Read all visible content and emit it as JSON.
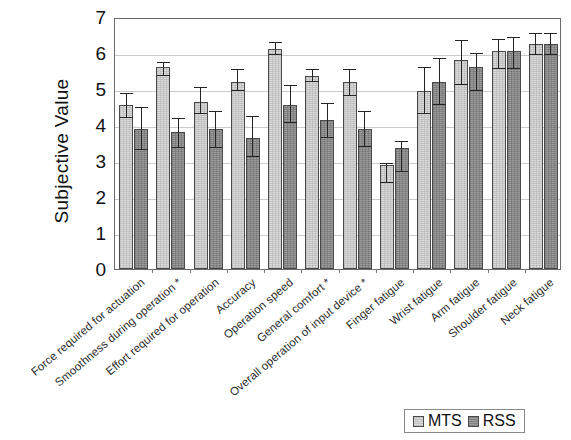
{
  "chart_data": {
    "type": "bar",
    "title": "",
    "xlabel": "",
    "ylabel": "Subjective Value",
    "ylim": [
      0,
      7
    ],
    "yticks": [
      0,
      1,
      2,
      3,
      4,
      5,
      6,
      7
    ],
    "grid": true,
    "legend_position": "bottom-right",
    "categories": [
      "Force required for actuation",
      "Smoothness during operation *",
      "Effort required for operation",
      "Accuracy",
      "Operation speed",
      "General comfort *",
      "Overall operation of input device *",
      "Finger fatigue",
      "Wrist fatigue",
      "Arm fatigue",
      "Shoulder fatigue",
      "Neck fatigue"
    ],
    "series": [
      {
        "name": "MTS",
        "color": "#d9d9d9",
        "values": [
          4.55,
          5.6,
          4.65,
          5.2,
          6.1,
          5.35,
          5.2,
          2.9,
          4.95,
          5.8,
          6.05,
          6.25
        ],
        "err_low": [
          4.2,
          5.35,
          4.3,
          4.95,
          5.95,
          5.2,
          4.8,
          2.4,
          4.3,
          5.1,
          5.55,
          5.95
        ],
        "err_high": [
          4.9,
          5.75,
          5.05,
          5.55,
          6.3,
          5.55,
          5.55,
          2.95,
          5.6,
          6.35,
          6.4,
          6.55
        ]
      },
      {
        "name": "RSS",
        "color": "#9b9b9b",
        "values": [
          3.9,
          3.8,
          3.9,
          3.65,
          4.55,
          4.15,
          3.9,
          3.35,
          5.2,
          5.6,
          6.05,
          6.25
        ],
        "err_low": [
          3.3,
          3.35,
          3.35,
          3.1,
          4.05,
          3.65,
          3.4,
          2.7,
          4.55,
          4.95,
          5.55,
          5.95
        ],
        "err_high": [
          4.5,
          4.2,
          4.4,
          4.25,
          5.1,
          4.6,
          4.4,
          3.55,
          5.85,
          6.0,
          6.45,
          6.55
        ]
      }
    ],
    "legend": [
      "MTS",
      "RSS"
    ],
    "footnote_marker": "*"
  },
  "legend": {
    "items": [
      {
        "label": "MTS",
        "color": "#d9d9d9"
      },
      {
        "label": "RSS",
        "color": "#9b9b9b"
      }
    ]
  },
  "axes": {
    "y_title": "Subjective Value",
    "y_ticks": [
      "0",
      "1",
      "2",
      "3",
      "4",
      "5",
      "6",
      "7"
    ]
  }
}
